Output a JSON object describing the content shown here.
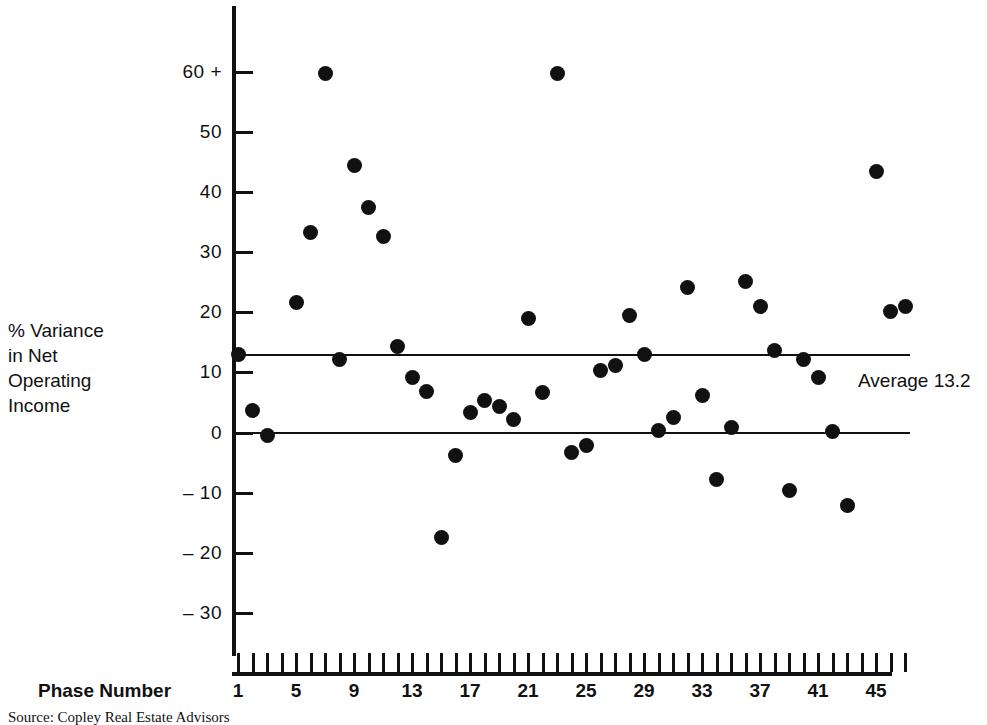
{
  "chart_data": {
    "type": "scatter",
    "title": "",
    "xlabel": "Phase Number",
    "ylabel": "% Variance in Net Operating Income",
    "ylabel_lines": [
      "% Variance",
      "in Net",
      "Operating",
      "Income"
    ],
    "xlim": [
      0,
      48
    ],
    "ylim": [
      -35,
      63
    ],
    "grid": false,
    "legend": null,
    "y_ticks": [
      60,
      50,
      40,
      30,
      20,
      10,
      0,
      -10,
      -20,
      -30
    ],
    "y_tick_labels": [
      "60 +",
      "50",
      "40",
      "30",
      "20",
      "10",
      "0",
      "– 10",
      "– 20",
      "– 30"
    ],
    "x_ticks": [
      1,
      2,
      3,
      4,
      5,
      6,
      7,
      8,
      9,
      10,
      11,
      12,
      13,
      14,
      15,
      16,
      17,
      18,
      19,
      20,
      21,
      22,
      23,
      24,
      25,
      26,
      27,
      28,
      29,
      30,
      31,
      32,
      33,
      34,
      35,
      36,
      37,
      38,
      39,
      40,
      41,
      42,
      43,
      44,
      45,
      46,
      47
    ],
    "x_tick_labels_shown": [
      "1",
      "5",
      "9",
      "13",
      "17",
      "21",
      "25",
      "29",
      "33",
      "37",
      "41",
      "45"
    ],
    "x_tick_labels_shown_values": [
      1,
      5,
      9,
      13,
      17,
      21,
      25,
      29,
      33,
      37,
      41,
      45
    ],
    "reference_lines": [
      {
        "name": "average",
        "value": 13.2,
        "label": "Average 13.2"
      },
      {
        "name": "zero",
        "value": 0,
        "label": ""
      }
    ],
    "note_y_top_capped": "60 + indicates values at or above 60",
    "x": [
      1,
      2,
      3,
      5,
      6,
      7,
      8,
      9,
      10,
      11,
      12,
      13,
      14,
      15,
      16,
      17,
      18,
      19,
      20,
      21,
      22,
      23,
      24,
      25,
      26,
      27,
      28,
      29,
      30,
      31,
      32,
      33,
      34,
      35,
      36,
      37,
      38,
      39,
      40,
      41,
      42,
      43,
      45,
      46,
      47
    ],
    "y": [
      13.0,
      3.7,
      -0.5,
      21.7,
      33.2,
      59.8,
      12.2,
      44.5,
      37.4,
      32.6,
      14.3,
      9.2,
      6.9,
      -17.5,
      -3.9,
      3.3,
      5.4,
      4.3,
      2.2,
      18.9,
      6.6,
      59.8,
      -3.4,
      -2.1,
      10.3,
      11.2,
      19.5,
      13.0,
      0.3,
      2.5,
      24.2,
      6.2,
      -7.8,
      0.9,
      25.1,
      21.0,
      13.7,
      -9.6,
      12.2,
      9.2,
      0.1,
      -12.1,
      43.5,
      20.2,
      20.9
    ],
    "points": [
      {
        "x": 1,
        "y": 13.0
      },
      {
        "x": 2,
        "y": 3.7
      },
      {
        "x": 3,
        "y": -0.5
      },
      {
        "x": 5,
        "y": 21.7
      },
      {
        "x": 6,
        "y": 33.2
      },
      {
        "x": 7,
        "y": 59.8
      },
      {
        "x": 8,
        "y": 12.2
      },
      {
        "x": 9,
        "y": 44.5
      },
      {
        "x": 10,
        "y": 37.4
      },
      {
        "x": 11,
        "y": 32.6
      },
      {
        "x": 12,
        "y": 14.3
      },
      {
        "x": 13,
        "y": 9.2
      },
      {
        "x": 14,
        "y": 6.9
      },
      {
        "x": 15,
        "y": -17.5
      },
      {
        "x": 16,
        "y": -3.9
      },
      {
        "x": 17,
        "y": 3.3
      },
      {
        "x": 18,
        "y": 5.4
      },
      {
        "x": 19,
        "y": 4.3
      },
      {
        "x": 20,
        "y": 2.2
      },
      {
        "x": 21,
        "y": 18.9
      },
      {
        "x": 22,
        "y": 6.6
      },
      {
        "x": 23,
        "y": 59.8
      },
      {
        "x": 24,
        "y": -3.4
      },
      {
        "x": 25,
        "y": -2.1
      },
      {
        "x": 26,
        "y": 10.3
      },
      {
        "x": 27,
        "y": 11.2
      },
      {
        "x": 28,
        "y": 19.5
      },
      {
        "x": 29,
        "y": 13.0
      },
      {
        "x": 30,
        "y": 0.3
      },
      {
        "x": 31,
        "y": 2.5
      },
      {
        "x": 32,
        "y": 24.2
      },
      {
        "x": 33,
        "y": 6.2
      },
      {
        "x": 34,
        "y": -7.8
      },
      {
        "x": 35,
        "y": 0.9
      },
      {
        "x": 36,
        "y": 25.1
      },
      {
        "x": 37,
        "y": 21.0
      },
      {
        "x": 38,
        "y": 13.7
      },
      {
        "x": 39,
        "y": -9.6
      },
      {
        "x": 40,
        "y": 12.2
      },
      {
        "x": 41,
        "y": 9.2
      },
      {
        "x": 42,
        "y": 0.1
      },
      {
        "x": 43,
        "y": -12.1
      },
      {
        "x": 45,
        "y": 43.5
      },
      {
        "x": 46,
        "y": 20.2
      },
      {
        "x": 47,
        "y": 20.9
      }
    ],
    "marker_color": "#111111",
    "axis_color": "#111111"
  },
  "source": {
    "text": "Source: Copley Real Estate Advisors"
  }
}
